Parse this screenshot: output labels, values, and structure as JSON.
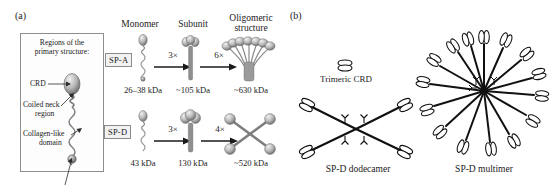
{
  "figure": {
    "panels": [
      {
        "id": "a",
        "label": "(a)"
      },
      {
        "id": "b",
        "label": "(b)"
      }
    ]
  },
  "panel_a": {
    "label": "(a)",
    "legend": {
      "title_line1": "Regions of the",
      "title_line2": "primary structure:",
      "items": [
        {
          "name": "crd",
          "label": "CRD"
        },
        {
          "name": "coiled-neck",
          "label_line1": "Coiled neck",
          "label_line2": "region"
        },
        {
          "name": "collagen-like",
          "label_line1": "Collagen-like",
          "label_line2": "domain"
        },
        {
          "name": "n-terminal",
          "label": "N-terminal region"
        }
      ]
    },
    "column_headers": [
      {
        "key": "monomer",
        "label": "Monomer"
      },
      {
        "key": "subunit",
        "label": "Subunit"
      },
      {
        "key": "oligomeric",
        "label_line1": "Oligomeric",
        "label_line2": "structure"
      }
    ],
    "rows": [
      {
        "protein": "SP-A",
        "monomer_mass": "26–38 kDa",
        "step1_multiplier": "3×",
        "subunit_mass": "~105 kDa",
        "step2_multiplier": "6×",
        "oligomer_mass": "~630 kDa"
      },
      {
        "protein": "SP-D",
        "monomer_mass": "43 kDa",
        "step1_multiplier": "3×",
        "subunit_mass": "130 kDa",
        "step2_multiplier": "4×",
        "oligomer_mass": "~520 kDa"
      }
    ]
  },
  "panel_b": {
    "label": "(b)",
    "trimeric_crd_label": "Trimeric CRD",
    "dodecamer_label": "SP-D dodecamer",
    "multimer_label": "SP-D multimer",
    "dodecamer_arms": 4,
    "multimer_arms": 15
  },
  "colors": {
    "ink": "#1a1a1a",
    "text": "#222222",
    "box_border": "#8b8b8b",
    "box_fill": "#f2f2f2",
    "legend_border": "#8d8d8d",
    "shade_light": "#e8e8e8",
    "shade_mid": "#9e9e9e",
    "shade_dark": "#5a5a5a",
    "background": "#ffffff"
  }
}
